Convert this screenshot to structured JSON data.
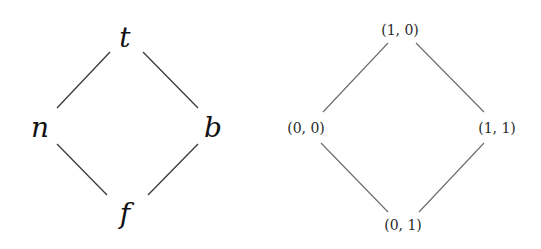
{
  "diagrams": [
    {
      "name": "four-valued-lattice",
      "nodes": {
        "top": {
          "label": "t",
          "x": 125,
          "y": 47
        },
        "left": {
          "label": "n",
          "x": 40,
          "y": 137
        },
        "right": {
          "label": "b",
          "x": 213,
          "y": 137
        },
        "bottom": {
          "label": "f",
          "x": 125,
          "y": 223
        }
      },
      "edges": [
        [
          "t",
          "n"
        ],
        [
          "t",
          "b"
        ],
        [
          "n",
          "f"
        ],
        [
          "b",
          "f"
        ]
      ]
    },
    {
      "name": "pair-lattice",
      "nodes": {
        "top": {
          "label": "(1, 0)",
          "x": 400,
          "y": 35
        },
        "left": {
          "label": "(0, 0)",
          "x": 306,
          "y": 133
        },
        "right": {
          "label": "(1, 1)",
          "x": 497,
          "y": 133
        },
        "bottom": {
          "label": "(0, 1)",
          "x": 403,
          "y": 230
        }
      },
      "edges": [
        [
          "(1, 0)",
          "(0, 0)"
        ],
        [
          "(1, 0)",
          "(1, 1)"
        ],
        [
          "(0, 0)",
          "(0, 1)"
        ],
        [
          "(1, 1)",
          "(0, 1)"
        ]
      ]
    }
  ]
}
